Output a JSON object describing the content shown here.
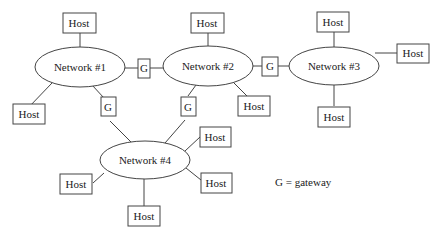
{
  "diagram": {
    "title": "",
    "networks": [
      {
        "id": "n1",
        "label": "Network #1"
      },
      {
        "id": "n2",
        "label": "Network #2"
      },
      {
        "id": "n3",
        "label": "Network #3"
      },
      {
        "id": "n4",
        "label": "Network #4"
      }
    ],
    "gateways": [
      {
        "id": "g12",
        "label": "G",
        "connects": [
          "Network #1",
          "Network #2"
        ]
      },
      {
        "id": "g23",
        "label": "G",
        "connects": [
          "Network #2",
          "Network #3"
        ]
      },
      {
        "id": "g14",
        "label": "G",
        "connects": [
          "Network #1",
          "Network #4"
        ]
      },
      {
        "id": "g24",
        "label": "G",
        "connects": [
          "Network #2",
          "Network #4"
        ]
      }
    ],
    "hosts": [
      {
        "id": "h1a",
        "label": "Host",
        "network": "Network #1"
      },
      {
        "id": "h1b",
        "label": "Host",
        "network": "Network #1"
      },
      {
        "id": "h2a",
        "label": "Host",
        "network": "Network #2"
      },
      {
        "id": "h2b",
        "label": "Host",
        "network": "Network #2"
      },
      {
        "id": "h3a",
        "label": "Host",
        "network": "Network #3"
      },
      {
        "id": "h3b",
        "label": "Host",
        "network": "Network #3"
      },
      {
        "id": "h3c",
        "label": "Host",
        "network": "Network #3"
      },
      {
        "id": "h4a",
        "label": "Host",
        "network": "Network #4"
      },
      {
        "id": "h4b",
        "label": "Host",
        "network": "Network #4"
      },
      {
        "id": "h4c",
        "label": "Host",
        "network": "Network #4"
      },
      {
        "id": "h4d",
        "label": "Host",
        "network": "Network #4"
      }
    ],
    "legend": "G = gateway"
  }
}
